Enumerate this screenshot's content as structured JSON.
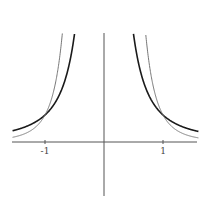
{
  "chart_data": {
    "type": "line",
    "title": "",
    "xlabel": "",
    "ylabel": "",
    "xlim": [
      -1.55,
      1.6
    ],
    "ylim": [
      -2.0,
      4.0
    ],
    "grid": false,
    "x_ticks": [
      {
        "value": -1,
        "label": "-1"
      },
      {
        "value": 1,
        "label": "1"
      }
    ],
    "series": [
      {
        "name": "y = 1/x^2",
        "stroke": "#1a1a1a",
        "width": 1.6,
        "exponent": 2
      },
      {
        "name": "y = 1/x^4",
        "stroke": "#777777",
        "width": 1.0,
        "exponent": 4
      }
    ],
    "annotations": [
      "curves intersect at (-1, 1) and (1, 1)"
    ]
  },
  "colors": {
    "axis": "#555555",
    "background": "#ffffff"
  }
}
